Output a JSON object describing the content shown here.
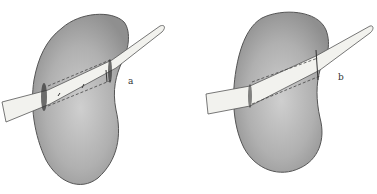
{
  "figure": {
    "panels": [
      {
        "id": "a",
        "label": "a",
        "description": "kidney with tube inserted, sutured tunnel"
      },
      {
        "id": "b",
        "label": "b",
        "description": "kidney with tube inserted, closed tunnel"
      }
    ],
    "colors": {
      "kidney_fill": "#a9a9a9",
      "kidney_outline": "#555555",
      "tube_fill": "#f2f2ee",
      "tube_outline": "#555555",
      "dash": "#444444"
    }
  }
}
